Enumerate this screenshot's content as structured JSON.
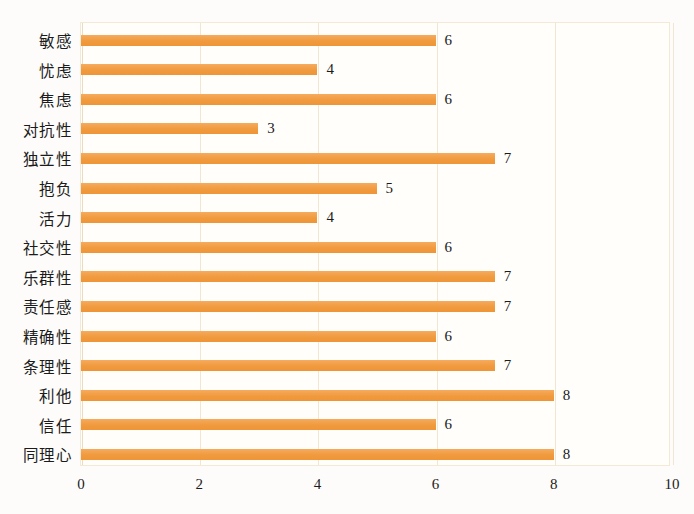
{
  "chart_data": {
    "type": "bar",
    "orientation": "horizontal",
    "title": "",
    "subtitle": "",
    "xlabel": "",
    "ylabel": "",
    "xlim": [
      0,
      10
    ],
    "xticks": [
      "0",
      "2",
      "4",
      "6",
      "8",
      "10"
    ],
    "xtick_values": [
      0,
      2,
      4,
      6,
      8,
      10
    ],
    "grid": true,
    "grid_axis": "x",
    "legend": false,
    "legend_position": "none",
    "bar_color": "#f2993f",
    "background_color": "#fdfcfa",
    "grid_color": "#f0e6d2",
    "show_value_labels": true,
    "categories": [
      "敏感",
      "忧虑",
      "焦虑",
      "对抗性",
      "独立性",
      "抱负",
      "活力",
      "社交性",
      "乐群性",
      "责任感",
      "精确性",
      "条理性",
      "利他",
      "信任",
      "同理心"
    ],
    "values": [
      6,
      4,
      6,
      3,
      7,
      5,
      4,
      6,
      7,
      7,
      6,
      7,
      8,
      6,
      8
    ],
    "value_labels": [
      "6",
      "4",
      "6",
      "3",
      "7",
      "5",
      "4",
      "6",
      "7",
      "7",
      "6",
      "7",
      "8",
      "6",
      "8"
    ]
  }
}
